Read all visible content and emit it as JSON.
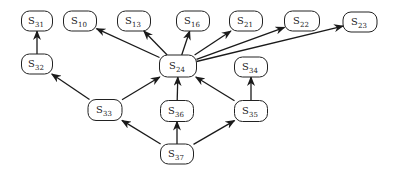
{
  "diagram": {
    "type": "directed-graph",
    "nodes": [
      {
        "id": "S31",
        "base": "S",
        "sub": "31",
        "x": 37,
        "y": 21,
        "w": 31,
        "h": 20
      },
      {
        "id": "S10",
        "base": "S",
        "sub": "10",
        "x": 80,
        "y": 21,
        "w": 33,
        "h": 20
      },
      {
        "id": "S13",
        "base": "S",
        "sub": "13",
        "x": 134,
        "y": 21,
        "w": 33,
        "h": 20
      },
      {
        "id": "S16",
        "base": "S",
        "sub": "16",
        "x": 193,
        "y": 21,
        "w": 33,
        "h": 20
      },
      {
        "id": "S21",
        "base": "S",
        "sub": "21",
        "x": 246,
        "y": 21,
        "w": 33,
        "h": 20
      },
      {
        "id": "S22",
        "base": "S",
        "sub": "22",
        "x": 302,
        "y": 21,
        "w": 35,
        "h": 20
      },
      {
        "id": "S23",
        "base": "S",
        "sub": "23",
        "x": 360,
        "y": 22,
        "w": 34,
        "h": 20
      },
      {
        "id": "S32",
        "base": "S",
        "sub": "32",
        "x": 37,
        "y": 64,
        "w": 31,
        "h": 20
      },
      {
        "id": "S24",
        "base": "S",
        "sub": "24",
        "x": 178,
        "y": 66,
        "w": 37,
        "h": 22
      },
      {
        "id": "S34",
        "base": "S",
        "sub": "34",
        "x": 251,
        "y": 67,
        "w": 33,
        "h": 20
      },
      {
        "id": "S33",
        "base": "S",
        "sub": "33",
        "x": 105,
        "y": 110,
        "w": 34,
        "h": 21
      },
      {
        "id": "S36",
        "base": "S",
        "sub": "36",
        "x": 177,
        "y": 111,
        "w": 33,
        "h": 21
      },
      {
        "id": "S35",
        "base": "S",
        "sub": "35",
        "x": 251,
        "y": 111,
        "w": 33,
        "h": 21
      },
      {
        "id": "S37",
        "base": "S",
        "sub": "37",
        "x": 177,
        "y": 154,
        "w": 33,
        "h": 20
      }
    ],
    "edges": [
      {
        "from": "S32",
        "to": "S31"
      },
      {
        "from": "S24",
        "to": "S10"
      },
      {
        "from": "S24",
        "to": "S13"
      },
      {
        "from": "S24",
        "to": "S16"
      },
      {
        "from": "S24",
        "to": "S21"
      },
      {
        "from": "S24",
        "to": "S22"
      },
      {
        "from": "S24",
        "to": "S23"
      },
      {
        "from": "S33",
        "to": "S32"
      },
      {
        "from": "S33",
        "to": "S24"
      },
      {
        "from": "S36",
        "to": "S24"
      },
      {
        "from": "S35",
        "to": "S24"
      },
      {
        "from": "S35",
        "to": "S34"
      },
      {
        "from": "S37",
        "to": "S33"
      },
      {
        "from": "S37",
        "to": "S36"
      },
      {
        "from": "S37",
        "to": "S35"
      }
    ]
  }
}
